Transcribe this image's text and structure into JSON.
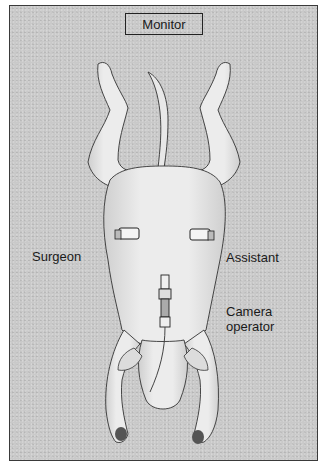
{
  "figure": {
    "monitor_label": "Monitor",
    "labels": {
      "surgeon": "Surgeon",
      "assistant": "Assistant",
      "camera_operator_line1": "Camera",
      "camera_operator_line2": "operator"
    },
    "colors": {
      "background": "#c9c9c9",
      "border": "#3a3a3a",
      "text": "#1a1a1a",
      "body": "#e4e4e4",
      "outline": "#333333"
    }
  }
}
